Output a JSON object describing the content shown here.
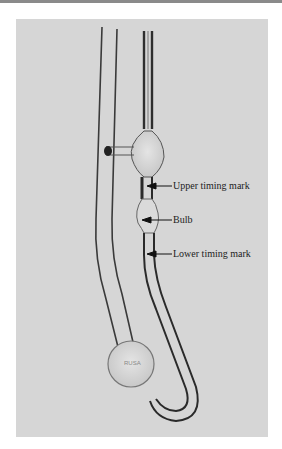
{
  "figure": {
    "background_color": "#d6d6d6",
    "annotations": [
      {
        "id": "upper",
        "label": "Upper timing mark"
      },
      {
        "id": "bulb",
        "label": "Bulb"
      },
      {
        "id": "lower",
        "label": "Lower timing mark"
      }
    ]
  }
}
